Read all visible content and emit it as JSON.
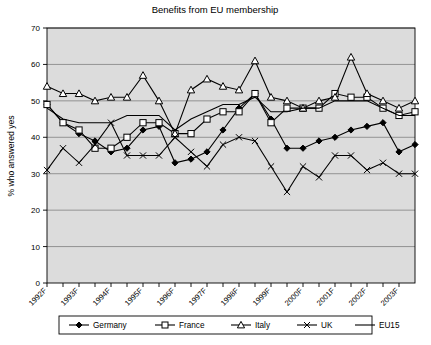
{
  "chart_data": {
    "type": "line",
    "title": "Benefits from EU membership",
    "xlabel": "",
    "ylabel": "% who answered yes",
    "ylim": [
      0,
      70
    ],
    "ytick_step": 10,
    "yticks": [
      0,
      10,
      20,
      30,
      40,
      50,
      60,
      70
    ],
    "grid": true,
    "legend_position": "bottom",
    "categories": [
      "1992F",
      "1993S",
      "1993F",
      "1994S",
      "1994F",
      "1995S",
      "1995F",
      "1996S",
      "1996F",
      "1997S",
      "1997F",
      "1998S",
      "1998F",
      "1999S",
      "1999F",
      "2000S",
      "2000F",
      "2001S",
      "2001F",
      "2002S",
      "2002F",
      "2003S",
      "2003F",
      "2003X"
    ],
    "xtick_labels": [
      "1992F",
      "1993F",
      "1994F",
      "1995F",
      "1996F",
      "1997F",
      "1998F",
      "1999F",
      "2000F",
      "2001F",
      "2002F",
      "2003F"
    ],
    "series": [
      {
        "name": "Germany",
        "marker": "filled-diamond",
        "values": [
          49,
          44,
          41,
          39,
          36,
          37,
          42,
          43,
          33,
          34,
          36,
          42,
          48,
          52,
          45,
          37,
          37,
          39,
          40,
          42,
          43,
          44,
          36,
          38
        ]
      },
      {
        "name": "France",
        "marker": "open-square",
        "values": [
          49,
          44,
          42,
          37,
          37,
          40,
          44,
          44,
          41,
          41,
          45,
          47,
          47,
          52,
          44,
          48,
          48,
          48,
          52,
          51,
          51,
          48,
          46,
          47
        ]
      },
      {
        "name": "Italy",
        "marker": "open-triangle",
        "values": [
          54,
          52,
          52,
          50,
          51,
          51,
          57,
          50,
          41,
          53,
          56,
          54,
          53,
          61,
          51,
          50,
          48,
          50,
          51,
          62,
          52,
          50,
          48,
          50
        ]
      },
      {
        "name": "UK",
        "marker": "cross-x",
        "values": [
          31,
          37,
          33,
          38,
          44,
          35,
          35,
          35,
          40,
          36,
          32,
          38,
          40,
          39,
          32,
          25,
          32,
          29,
          35,
          35,
          31,
          33,
          30,
          30
        ]
      },
      {
        "name": "EU15",
        "marker": "plain-line",
        "values": [
          48,
          45,
          44,
          44,
          44,
          46,
          46,
          46,
          42,
          45,
          47,
          49,
          49,
          51,
          47,
          47,
          48,
          48,
          50,
          50,
          50,
          48,
          46,
          46
        ]
      }
    ]
  },
  "legend": {
    "items": [
      {
        "label": "Germany"
      },
      {
        "label": "France"
      },
      {
        "label": "Italy"
      },
      {
        "label": "UK"
      },
      {
        "label": "EU15"
      }
    ]
  }
}
